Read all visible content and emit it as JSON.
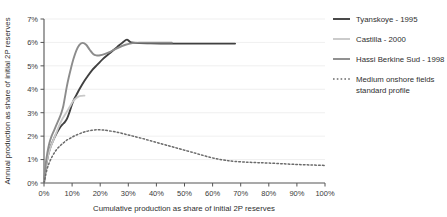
{
  "chart_data": {
    "type": "line",
    "title": "",
    "xlabel": "Cumulative production as share of initial 2P reserves",
    "ylabel": "Annual production as share of initial 2P reserves",
    "xlim": [
      0,
      100
    ],
    "ylim": [
      0,
      7
    ],
    "grid": true,
    "legend_position": "right",
    "xticks": [
      "0%",
      "10%",
      "20%",
      "30%",
      "40%",
      "50%",
      "60%",
      "70%",
      "80%",
      "90%",
      "100%"
    ],
    "xtick_values": [
      0,
      10,
      20,
      30,
      40,
      50,
      60,
      70,
      80,
      90,
      100
    ],
    "yticks": [
      "0%",
      "1%",
      "2%",
      "3%",
      "4%",
      "5%",
      "6%",
      "7%"
    ],
    "ytick_values": [
      0,
      1,
      2,
      3,
      4,
      5,
      6,
      7
    ],
    "series": [
      {
        "name": "Tyanskoye - 1995",
        "style": "solid",
        "color": "#404040",
        "width": 1.9,
        "points": [
          [
            0.0,
            0.0
          ],
          [
            0.6,
            0.6
          ],
          [
            1.3,
            1.1
          ],
          [
            2.2,
            1.5
          ],
          [
            3.2,
            1.8
          ],
          [
            4.4,
            2.1
          ],
          [
            5.6,
            2.35
          ],
          [
            6.6,
            2.5
          ],
          [
            7.4,
            2.6
          ],
          [
            8.2,
            2.75
          ],
          [
            9.0,
            3.0
          ],
          [
            9.8,
            3.3
          ],
          [
            10.6,
            3.55
          ],
          [
            11.5,
            3.75
          ],
          [
            12.6,
            4.0
          ],
          [
            13.8,
            4.25
          ],
          [
            15.2,
            4.5
          ],
          [
            17.0,
            4.8
          ],
          [
            19.0,
            5.05
          ],
          [
            21.0,
            5.3
          ],
          [
            23.5,
            5.55
          ],
          [
            26.0,
            5.8
          ],
          [
            28.0,
            6.0
          ],
          [
            29.5,
            6.12
          ],
          [
            31.0,
            6.0
          ],
          [
            34.0,
            5.97
          ],
          [
            38.0,
            5.96
          ],
          [
            44.0,
            5.95
          ],
          [
            50.0,
            5.95
          ],
          [
            56.0,
            5.95
          ],
          [
            62.0,
            5.95
          ],
          [
            68.0,
            5.95
          ]
        ]
      },
      {
        "name": "Castilla - 2000",
        "style": "solid",
        "color": "#c9c9c9",
        "width": 1.9,
        "points": [
          [
            0.0,
            0.0
          ],
          [
            0.7,
            0.7
          ],
          [
            1.5,
            1.2
          ],
          [
            2.4,
            1.55
          ],
          [
            3.4,
            1.85
          ],
          [
            4.4,
            2.15
          ],
          [
            5.4,
            2.45
          ],
          [
            6.4,
            2.7
          ],
          [
            7.4,
            2.9
          ],
          [
            8.4,
            3.1
          ],
          [
            9.4,
            3.3
          ],
          [
            10.4,
            3.5
          ],
          [
            11.4,
            3.62
          ],
          [
            12.4,
            3.7
          ],
          [
            13.4,
            3.72
          ],
          [
            14.4,
            3.73
          ]
        ]
      },
      {
        "name": "Hassi Berkine Sud - 1998",
        "style": "solid",
        "color": "#8c8c8c",
        "width": 1.9,
        "points": [
          [
            0.0,
            0.0
          ],
          [
            0.6,
            0.8
          ],
          [
            1.2,
            1.3
          ],
          [
            1.9,
            1.7
          ],
          [
            2.7,
            2.0
          ],
          [
            3.6,
            2.25
          ],
          [
            4.5,
            2.5
          ],
          [
            5.4,
            2.75
          ],
          [
            6.2,
            3.0
          ],
          [
            6.9,
            3.3
          ],
          [
            7.5,
            3.7
          ],
          [
            8.1,
            4.1
          ],
          [
            8.8,
            4.5
          ],
          [
            9.6,
            4.9
          ],
          [
            10.5,
            5.3
          ],
          [
            11.5,
            5.65
          ],
          [
            12.6,
            5.9
          ],
          [
            13.8,
            5.98
          ],
          [
            15.0,
            5.9
          ],
          [
            16.2,
            5.7
          ],
          [
            17.4,
            5.52
          ],
          [
            18.6,
            5.45
          ],
          [
            20.0,
            5.45
          ],
          [
            21.5,
            5.5
          ],
          [
            23.5,
            5.6
          ],
          [
            26.0,
            5.75
          ],
          [
            29.0,
            5.9
          ],
          [
            31.5,
            5.97
          ],
          [
            34.0,
            5.99
          ],
          [
            38.0,
            5.99
          ],
          [
            42.0,
            5.99
          ],
          [
            45.5,
            5.99
          ]
        ]
      },
      {
        "name": "Medium onshore fields standard profile",
        "style": "dotted",
        "color": "#6b6b6b",
        "width": 1.5,
        "points": [
          [
            0.0,
            0.0
          ],
          [
            1.0,
            0.55
          ],
          [
            2.0,
            0.9
          ],
          [
            3.0,
            1.15
          ],
          [
            4.0,
            1.35
          ],
          [
            5.0,
            1.5
          ],
          [
            6.0,
            1.62
          ],
          [
            7.0,
            1.72
          ],
          [
            8.0,
            1.82
          ],
          [
            9.5,
            1.92
          ],
          [
            11.0,
            2.02
          ],
          [
            13.0,
            2.12
          ],
          [
            15.0,
            2.2
          ],
          [
            17.0,
            2.25
          ],
          [
            19.0,
            2.27
          ],
          [
            21.0,
            2.26
          ],
          [
            23.0,
            2.23
          ],
          [
            26.0,
            2.17
          ],
          [
            29.0,
            2.08
          ],
          [
            32.0,
            1.99
          ],
          [
            35.0,
            1.9
          ],
          [
            38.0,
            1.8
          ],
          [
            41.0,
            1.7
          ],
          [
            44.0,
            1.6
          ],
          [
            47.0,
            1.5
          ],
          [
            50.0,
            1.4
          ],
          [
            53.0,
            1.3
          ],
          [
            56.0,
            1.2
          ],
          [
            59.0,
            1.1
          ],
          [
            62.0,
            1.02
          ],
          [
            65.0,
            0.96
          ],
          [
            68.0,
            0.92
          ],
          [
            72.0,
            0.89
          ],
          [
            76.0,
            0.87
          ],
          [
            80.0,
            0.85
          ],
          [
            85.0,
            0.82
          ],
          [
            90.0,
            0.79
          ],
          [
            95.0,
            0.77
          ],
          [
            100.0,
            0.75
          ]
        ]
      }
    ]
  },
  "legend": {
    "items": [
      {
        "label": "Tyanskoye - 1995"
      },
      {
        "label": "Castilla - 2000"
      },
      {
        "label": "Hassi Berkine Sud - 1998"
      },
      {
        "label": "Medium onshore fields"
      },
      {
        "label": "standard profile"
      }
    ]
  },
  "colors": {
    "series_1": "#404040",
    "series_2": "#c9c9c9",
    "series_3": "#8c8c8c",
    "series_4": "#6b6b6b",
    "axis": "#555555",
    "grid": "#ebebeb",
    "text": "#2e2e2e",
    "background": "#ffffff"
  }
}
